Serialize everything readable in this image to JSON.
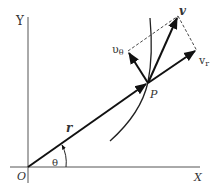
{
  "diagram": {
    "colors": {
      "line": "#222222",
      "axis": "#555555",
      "text": "#333333",
      "background": "#ffffff"
    },
    "axes": {
      "x_label": "X",
      "y_label": "Y",
      "origin_label": "O"
    },
    "point": {
      "label": "P"
    },
    "vectors": {
      "position": {
        "label": "r"
      },
      "velocity": {
        "label": "v"
      },
      "radial": {
        "label": "v",
        "subscript": "r"
      },
      "transverse": {
        "label": "υ",
        "subscript": "θ"
      }
    },
    "angle": {
      "label": "θ"
    },
    "curve": {
      "label": "path"
    }
  }
}
